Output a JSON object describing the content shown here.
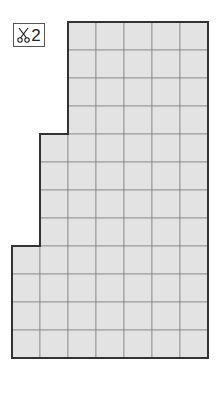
{
  "header": {
    "clipped_text": ""
  },
  "badge": {
    "icon": "scissors-icon",
    "count": "2"
  },
  "shape": {
    "cell_size": 28,
    "origin_x": 12,
    "origin_y": 22,
    "rows": 12,
    "cols": 7,
    "row_spans": [
      {
        "rows": [
          0,
          3
        ],
        "col_start": 2,
        "col_end": 7
      },
      {
        "rows": [
          4,
          7
        ],
        "col_start": 1,
        "col_end": 7
      },
      {
        "rows": [
          8,
          11
        ],
        "col_start": 0,
        "col_end": 7
      }
    ],
    "fill": "#e3e3e3",
    "grid_line": "#8a8a8a",
    "outline": "#333333"
  }
}
